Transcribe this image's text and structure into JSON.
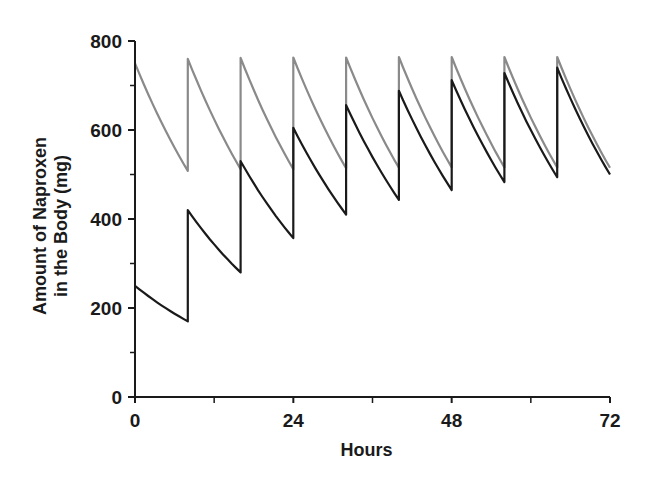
{
  "chart_data": {
    "type": "line",
    "title": "",
    "xlabel": "Hours",
    "ylabel_lines": [
      "Amount of Naproxen",
      "in the Body (mg)"
    ],
    "ylabel": "Amount of Naproxen in the Body (mg)",
    "xlim": [
      0,
      72
    ],
    "ylim": [
      0,
      800
    ],
    "x_ticks": [
      0,
      24,
      48,
      72
    ],
    "x_minor_ticks": [
      12,
      36,
      60
    ],
    "y_ticks": [
      0,
      200,
      400,
      600,
      800
    ],
    "y_minor_ticks": [
      100,
      300,
      500,
      700
    ],
    "x_tick_labels": [
      "0",
      "24",
      "48",
      "72"
    ],
    "y_tick_labels": [
      "0",
      "200",
      "400",
      "600",
      "800"
    ],
    "grid": false,
    "legend": null,
    "dosing_interval_hours": 8,
    "series": [
      {
        "name": "Loading dose (gray)",
        "color": "#8a8a8a",
        "points": [
          [
            0,
            750
          ],
          [
            8,
            508
          ],
          [
            8,
            760
          ],
          [
            16,
            512
          ],
          [
            16,
            762
          ],
          [
            24,
            512
          ],
          [
            24,
            763
          ],
          [
            32,
            514
          ],
          [
            32,
            763
          ],
          [
            40,
            515
          ],
          [
            40,
            764
          ],
          [
            48,
            516
          ],
          [
            48,
            764
          ],
          [
            56,
            516
          ],
          [
            56,
            764
          ],
          [
            64,
            516
          ],
          [
            64,
            764
          ],
          [
            72,
            515
          ]
        ]
      },
      {
        "name": "No loading dose (black)",
        "color": "#1a1a1a",
        "points": [
          [
            0,
            250
          ],
          [
            8,
            170
          ],
          [
            8,
            420
          ],
          [
            16,
            280
          ],
          [
            16,
            530
          ],
          [
            24,
            357
          ],
          [
            24,
            605
          ],
          [
            32,
            410
          ],
          [
            32,
            656
          ],
          [
            40,
            443
          ],
          [
            40,
            688
          ],
          [
            48,
            465
          ],
          [
            48,
            712
          ],
          [
            56,
            483
          ],
          [
            56,
            728
          ],
          [
            64,
            494
          ],
          [
            64,
            740
          ],
          [
            72,
            500
          ]
        ]
      }
    ]
  },
  "colors": {
    "axis": "#1a1a1a",
    "background": "#ffffff"
  }
}
